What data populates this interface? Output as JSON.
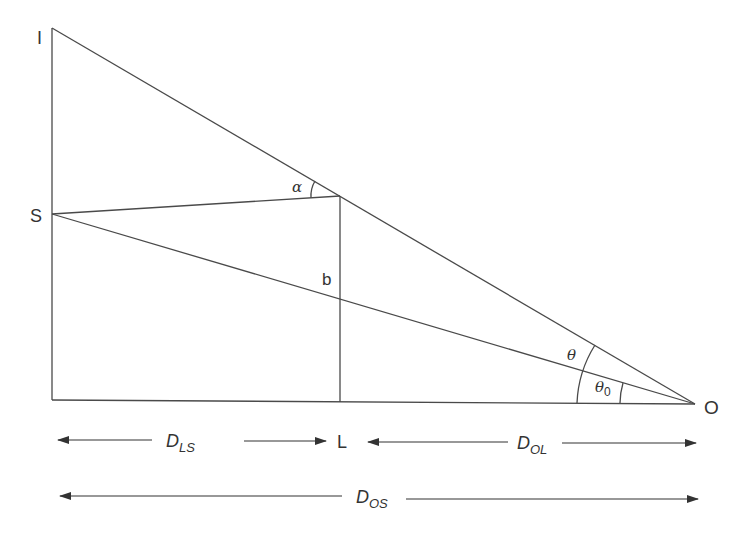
{
  "diagram": {
    "type": "gravitational-lensing-geometry",
    "colors": {
      "line": "#4a4a4a",
      "text": "#333333",
      "background": "#ffffff"
    },
    "points": {
      "image": {
        "label": "I"
      },
      "source": {
        "label": "S"
      },
      "lens": {
        "label": "L"
      },
      "observer": {
        "label": "O"
      },
      "impact_parameter": {
        "label": "b"
      }
    },
    "angles": {
      "deflection": {
        "label": "α"
      },
      "image_angle": {
        "label": "θ"
      },
      "source_angle": {
        "label": "θ",
        "subscript": "0"
      }
    },
    "distances": {
      "lens_source": {
        "label": "D",
        "subscript": "LS"
      },
      "observer_lens": {
        "label": "D",
        "subscript": "OL"
      },
      "observer_source": {
        "label": "D",
        "subscript": "OS"
      }
    }
  }
}
